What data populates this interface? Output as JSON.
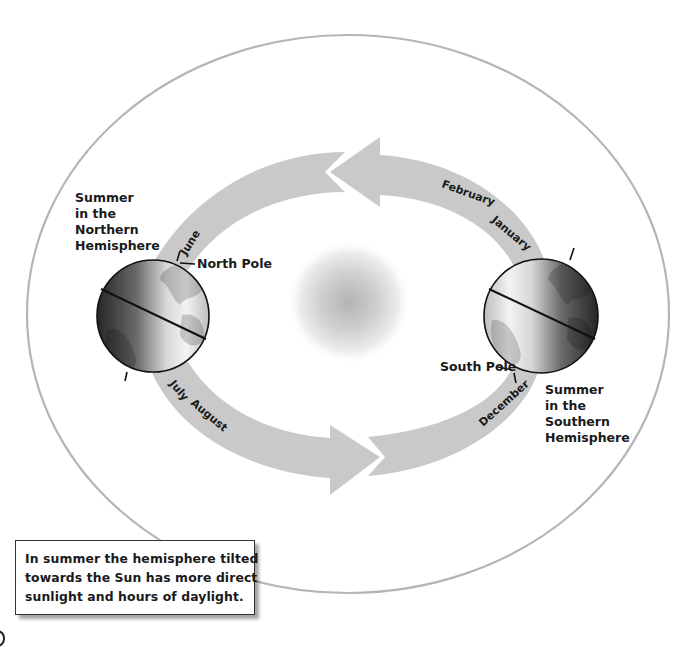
{
  "diagram": {
    "colors": {
      "orbit_line": "#b5b5b5",
      "arrow_band": "#c9c9c9",
      "sun_core": "#b8b8b8",
      "globe_dark": "#2b2b2b",
      "globe_light": "#f2f2f2",
      "text": "#1a1a1a"
    },
    "left_globe": {
      "season_label": [
        "Summer",
        "in the",
        "Northern",
        "Hemisphere"
      ],
      "pole_label": "North Pole"
    },
    "right_globe": {
      "season_label": [
        "Summer",
        "in the",
        "Southern",
        "Hemisphere"
      ],
      "pole_label": "South Pole"
    },
    "months": {
      "june": "June",
      "july": "July",
      "august": "August",
      "december": "December",
      "january": "January",
      "february": "February"
    },
    "callout": {
      "lines": [
        "In summer the hemisphere tilted",
        "towards the Sun has more direct",
        "sunlight and hours of daylight."
      ]
    },
    "icons": {
      "sun": "sun-icon",
      "earth": "earth-globe-icon",
      "arrow": "orbit-direction-arrow-icon"
    }
  }
}
